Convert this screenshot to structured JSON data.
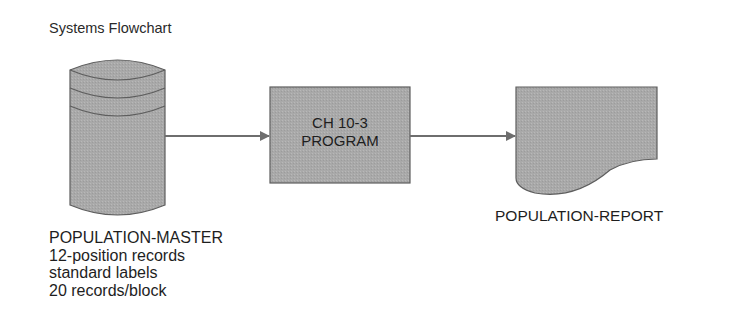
{
  "title": "Systems Flowchart",
  "colors": {
    "shape_fill": "#a9a9a9",
    "shape_stroke": "#5e5e5e",
    "arrow": "#6e6e6e",
    "text": "#1e1e1e"
  },
  "nodes": {
    "input": {
      "shape": "magnetic-tape-cylinder",
      "name": "POPULATION-MASTER",
      "details": [
        "12-position records",
        "standard labels",
        "20 records/block"
      ]
    },
    "process": {
      "shape": "process-box",
      "lines": [
        "CH 10-3",
        "PROGRAM"
      ]
    },
    "output": {
      "shape": "document",
      "name": "POPULATION-REPORT"
    }
  },
  "edges": [
    {
      "from": "POPULATION-MASTER",
      "to": "CH 10-3 PROGRAM"
    },
    {
      "from": "CH 10-3 PROGRAM",
      "to": "POPULATION-REPORT"
    }
  ]
}
